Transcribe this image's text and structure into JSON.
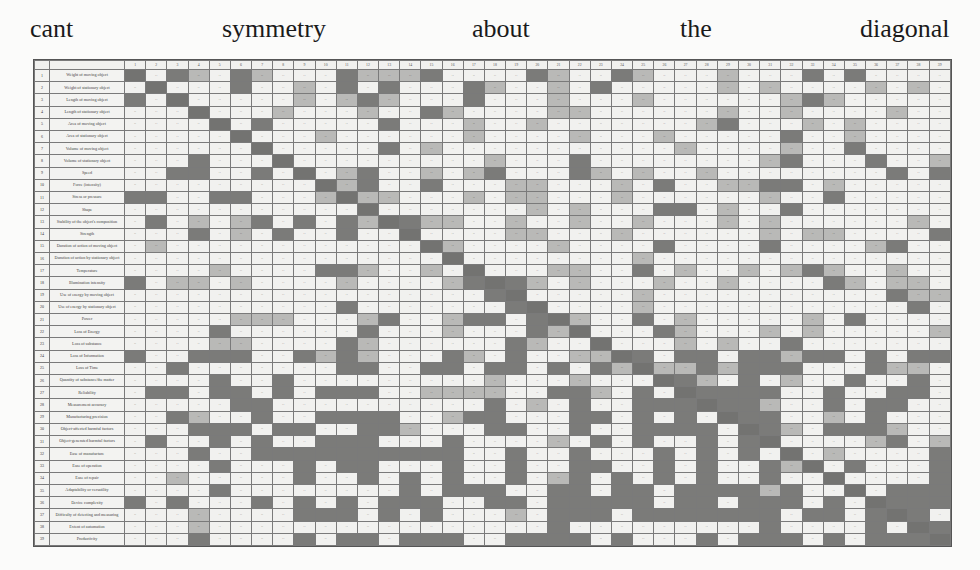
{
  "caption": {
    "words": [
      {
        "text": "cant",
        "left": 30
      },
      {
        "text": "symmetry",
        "left": 222
      },
      {
        "text": "about",
        "left": 472
      },
      {
        "text": "the",
        "left": 680
      },
      {
        "text": "diagonal",
        "left": 860
      }
    ]
  },
  "matrix": {
    "title": "TRIZ contradiction matrix",
    "column_numbers": [
      "1",
      "2",
      "3",
      "4",
      "5",
      "6",
      "7",
      "8",
      "9",
      "10",
      "11",
      "12",
      "13",
      "14",
      "15",
      "16",
      "17",
      "18",
      "19",
      "20",
      "21",
      "22",
      "23",
      "24",
      "25",
      "26",
      "27",
      "28",
      "29",
      "30",
      "31",
      "32",
      "33",
      "34",
      "35",
      "36",
      "37",
      "38",
      "39"
    ],
    "rows": [
      {
        "n": "1",
        "label": "Weight of moving object"
      },
      {
        "n": "2",
        "label": "Weight of stationary object"
      },
      {
        "n": "3",
        "label": "Length of moving object"
      },
      {
        "n": "4",
        "label": "Length of stationary object"
      },
      {
        "n": "5",
        "label": "Area of moving object"
      },
      {
        "n": "6",
        "label": "Area of stationary object"
      },
      {
        "n": "7",
        "label": "Volume of moving object"
      },
      {
        "n": "8",
        "label": "Volume of stationary object"
      },
      {
        "n": "9",
        "label": "Speed"
      },
      {
        "n": "10",
        "label": "Force (intensity)"
      },
      {
        "n": "11",
        "label": "Stress or pressure"
      },
      {
        "n": "12",
        "label": "Shape"
      },
      {
        "n": "13",
        "label": "Stability of the object's composition"
      },
      {
        "n": "14",
        "label": "Strength"
      },
      {
        "n": "15",
        "label": "Duration of action of moving object"
      },
      {
        "n": "16",
        "label": "Duration of action by stationary object"
      },
      {
        "n": "17",
        "label": "Temperature"
      },
      {
        "n": "18",
        "label": "Illumination intensity"
      },
      {
        "n": "19",
        "label": "Use of energy by moving object"
      },
      {
        "n": "20",
        "label": "Use of energy by stationary object"
      },
      {
        "n": "21",
        "label": "Power"
      },
      {
        "n": "22",
        "label": "Loss of Energy"
      },
      {
        "n": "23",
        "label": "Loss of substance"
      },
      {
        "n": "24",
        "label": "Loss of Information"
      },
      {
        "n": "25",
        "label": "Loss of Time"
      },
      {
        "n": "26",
        "label": "Quantity of substance/the matter"
      },
      {
        "n": "27",
        "label": "Reliability"
      },
      {
        "n": "28",
        "label": "Measurement accuracy"
      },
      {
        "n": "29",
        "label": "Manufacturing precision"
      },
      {
        "n": "30",
        "label": "Object-affected harmful factors"
      },
      {
        "n": "31",
        "label": "Object-generated harmful factors"
      },
      {
        "n": "32",
        "label": "Ease of manufacture"
      },
      {
        "n": "33",
        "label": "Ease of operation"
      },
      {
        "n": "34",
        "label": "Ease of repair"
      },
      {
        "n": "35",
        "label": "Adaptability or versatility"
      },
      {
        "n": "36",
        "label": "Device complexity"
      },
      {
        "n": "37",
        "label": "Difficulty of detecting and measuring"
      },
      {
        "n": "38",
        "label": "Extent of automation"
      },
      {
        "n": "39",
        "label": "Productivity"
      }
    ],
    "cell_text_placeholder": "··",
    "shade_legend": {
      "0": "#f1f1ef",
      "1": "#b9b9b7",
      "2": "#7b7b79"
    },
    "shading": [
      "2021021000211120000210021000100020200000",
      "0200020010202000210010200000101000010100",
      "2020000010121000200010001000000121000000",
      "0001000100010021000011000000100100001000",
      "0000202000002000100100000001200010100000",
      "0000020001000000100001000100000200100000",
      "0000001000002010000000000010000100200000",
      "0002000200000000010002000000001200020010",
      "0022002020120010120002101001000000002020",
      "0000000002120020001100010200112201000000",
      "2200220001211000101100010000001002000000",
      "0000000000020000000101000220100200000000",
      "0201012020210211001001001000101000000100",
      "0002010200200200001100010000001011000020",
      "0100000000000021000010000200002000012000",
      "0000000000000002000000001000000000000000",
      "0000100002210010200011002010010121001000",
      "2011010000100001202101000100100002101100",
      "0000000000000000020000001000000000002110",
      "0000000000200000002000001000000000000200",
      "0000011100012001220211002010000010200000",
      "0000200000020001000212000210001010000011",
      "0000110000210000002100200010100200000000",
      "2002220021210002102001122022022122020221",
      "0020000000220022022020212112122200021101",
      "0000200200000000010001000021020100200200",
      "0220220202220011110022102022222002002200",
      "0000022000000000020102002222221002022002",
      "0021002002222001220002202020022001020001",
      "0002220220022100022002002222002102221000",
      "0200202002220002000010202002020000012010",
      "0002002222222222002002000202020001000022",
      "0000200020220002002002200202002100200022",
      "0010000020020202002012020202002001000022",
      "0000200000000202220022022022221200002221",
      "2020002020202220022022222022022202022222",
      "0001000022202020001022202222222022022202",
      "0001000000000000000020000000002000020222",
      "0002000020220222002222020002022202022222"
    ]
  }
}
